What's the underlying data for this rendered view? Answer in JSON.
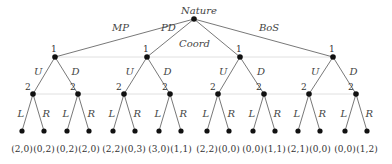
{
  "root": {
    "label": "Nature",
    "x": 194,
    "y": 19
  },
  "nature_moves": [
    "MP",
    "PD",
    "Coord",
    "BoS"
  ],
  "player1": {
    "label": "1",
    "moves": [
      "U",
      "D"
    ]
  },
  "player2": {
    "label": "2",
    "moves": [
      "L",
      "R"
    ]
  },
  "payoffs": [
    "(2,0)",
    "(0,2)",
    "(0,2)",
    "(2,0)",
    "(2,2)",
    "(0,3)",
    "(3,0)",
    "(1,1)",
    "(2,2)",
    "(0,0)",
    "(0,0)",
    "(1,1)",
    "(2,1)",
    "(0,0)",
    "(0,0)",
    "(1,2)"
  ],
  "games": [
    {
      "name": "MP",
      "payoffs": [
        "(2,0)",
        "(0,2)",
        "(0,2)",
        "(2,0)"
      ]
    },
    {
      "name": "PD",
      "payoffs": [
        "(2,2)",
        "(0,3)",
        "(3,0)",
        "(1,1)"
      ]
    },
    {
      "name": "Coord",
      "payoffs": [
        "(2,2)",
        "(0,0)",
        "(0,0)",
        "(1,1)"
      ]
    },
    {
      "name": "BoS",
      "payoffs": [
        "(2,1)",
        "(0,0)",
        "(0,0)",
        "(1,2)"
      ]
    }
  ]
}
